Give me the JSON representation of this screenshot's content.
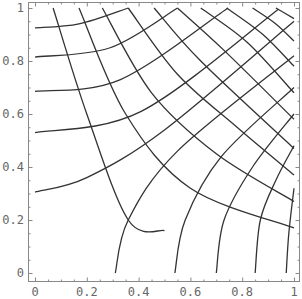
{
  "chart_data": {
    "type": "line",
    "title": "",
    "xlabel": "",
    "ylabel": "",
    "xlim": [
      0,
      1
    ],
    "ylim": [
      0,
      1
    ],
    "grid": false,
    "legend": null,
    "x_ticks": [
      "0",
      "0.2",
      "0.4",
      "0.6",
      "0.8",
      "1"
    ],
    "y_ticks": [
      "0",
      "0.2",
      "0.4",
      "0.6",
      "0.8",
      "1"
    ],
    "series": [
      {
        "name": "rising-1",
        "points": [
          [
            0.0,
            0.925
          ],
          [
            0.17,
            0.94
          ],
          [
            0.36,
            1.0
          ]
        ]
      },
      {
        "name": "rising-2",
        "points": [
          [
            0.0,
            0.815
          ],
          [
            0.29,
            0.85
          ],
          [
            0.55,
            1.0
          ]
        ]
      },
      {
        "name": "rising-3",
        "points": [
          [
            0.0,
            0.685
          ],
          [
            0.33,
            0.73
          ],
          [
            0.745,
            1.0
          ]
        ]
      },
      {
        "name": "rising-4",
        "points": [
          [
            0.0,
            0.53
          ],
          [
            0.41,
            0.61
          ],
          [
            0.94,
            0.995
          ]
        ]
      },
      {
        "name": "rising-5",
        "points": [
          [
            0.0,
            0.305
          ],
          [
            0.2,
            0.36
          ],
          [
            0.5,
            0.54
          ],
          [
            1.0,
            0.95
          ]
        ]
      },
      {
        "name": "rising-6",
        "points": [
          [
            0.31,
            0.0
          ],
          [
            0.36,
            0.2
          ],
          [
            0.55,
            0.46
          ],
          [
            1.0,
            0.82
          ]
        ]
      },
      {
        "name": "rising-7",
        "points": [
          [
            0.54,
            0.0
          ],
          [
            0.58,
            0.2
          ],
          [
            0.72,
            0.44
          ],
          [
            1.0,
            0.7
          ]
        ]
      },
      {
        "name": "rising-8",
        "points": [
          [
            0.7,
            0.0
          ],
          [
            0.73,
            0.2
          ],
          [
            0.84,
            0.4
          ],
          [
            1.0,
            0.6
          ]
        ]
      },
      {
        "name": "rising-9",
        "points": [
          [
            0.85,
            0.0
          ],
          [
            0.87,
            0.2
          ],
          [
            0.93,
            0.35
          ],
          [
            1.0,
            0.48
          ]
        ]
      },
      {
        "name": "rising-10",
        "points": [
          [
            0.97,
            0.0
          ],
          [
            0.98,
            0.15
          ],
          [
            1.0,
            0.32
          ]
        ]
      },
      {
        "name": "descending-1",
        "points": [
          [
            0.07,
            1.0
          ],
          [
            0.2,
            0.6
          ],
          [
            0.36,
            0.2
          ],
          [
            0.5,
            0.16
          ]
        ]
      },
      {
        "name": "descending-2",
        "points": [
          [
            0.17,
            1.0
          ],
          [
            0.35,
            0.6
          ],
          [
            0.6,
            0.32
          ],
          [
            1.0,
            0.17
          ]
        ]
      },
      {
        "name": "descending-3",
        "points": [
          [
            0.26,
            1.0
          ],
          [
            0.45,
            0.68
          ],
          [
            0.7,
            0.45
          ],
          [
            1.0,
            0.27
          ]
        ]
      },
      {
        "name": "descending-4",
        "points": [
          [
            0.36,
            1.0
          ],
          [
            0.55,
            0.75
          ],
          [
            0.78,
            0.55
          ],
          [
            1.0,
            0.37
          ]
        ]
      },
      {
        "name": "descending-5",
        "points": [
          [
            0.46,
            1.0
          ],
          [
            0.64,
            0.8
          ],
          [
            1.0,
            0.47
          ]
        ]
      },
      {
        "name": "descending-6",
        "points": [
          [
            0.55,
            1.0
          ],
          [
            0.73,
            0.84
          ],
          [
            1.0,
            0.58
          ]
        ]
      },
      {
        "name": "descending-7",
        "points": [
          [
            0.64,
            1.0
          ],
          [
            0.82,
            0.87
          ],
          [
            1.0,
            0.68
          ]
        ]
      },
      {
        "name": "descending-8",
        "points": [
          [
            0.74,
            1.0
          ],
          [
            0.88,
            0.9
          ],
          [
            1.0,
            0.78
          ]
        ]
      },
      {
        "name": "descending-9",
        "points": [
          [
            0.84,
            1.0
          ],
          [
            0.93,
            0.94
          ],
          [
            1.0,
            0.875
          ]
        ]
      },
      {
        "name": "descending-10",
        "points": [
          [
            0.93,
            1.0
          ],
          [
            1.0,
            0.96
          ]
        ]
      }
    ]
  }
}
